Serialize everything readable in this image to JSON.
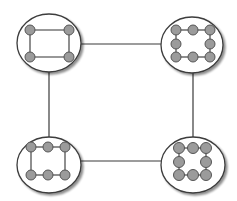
{
  "diagram": {
    "type": "network-of-clusters",
    "width": 237,
    "height": 201,
    "colors": {
      "background": "#ffffff",
      "edge": "#3a3a3a",
      "cluster_fill": "#ffffff",
      "cluster_stroke": "#3c3c3c",
      "cluster_shadow": "#9a9a9a",
      "node_fill": "#9b9b9b",
      "node_stroke": "#555555",
      "inner_edge": "#333333"
    },
    "inter_cluster_edges": [
      {
        "id": "top",
        "x1": 81,
        "y1": 44,
        "x2": 162,
        "y2": 44
      },
      {
        "id": "bottom",
        "x1": 81,
        "y1": 161,
        "x2": 161,
        "y2": 161
      },
      {
        "id": "left",
        "x1": 49,
        "y1": 72,
        "x2": 49,
        "y2": 137
      },
      {
        "id": "right",
        "x1": 193,
        "y1": 73,
        "x2": 193,
        "y2": 138
      }
    ],
    "clusters": [
      {
        "id": "top-left",
        "cx": 49,
        "cy": 43,
        "rx": 32,
        "ry": 29,
        "node_r": 5,
        "nodes": [
          [
            30,
            30
          ],
          [
            69,
            30
          ],
          [
            69,
            57
          ],
          [
            30,
            57
          ]
        ],
        "ring": true
      },
      {
        "id": "top-right",
        "cx": 192,
        "cy": 45,
        "rx": 31,
        "ry": 28,
        "node_r": 5,
        "nodes": [
          [
            176,
            30
          ],
          [
            193,
            30
          ],
          [
            210,
            30
          ],
          [
            210,
            44
          ],
          [
            210,
            57
          ],
          [
            193,
            57
          ],
          [
            176,
            57
          ],
          [
            176,
            44
          ]
        ],
        "ring": true
      },
      {
        "id": "bottom-left",
        "cx": 49,
        "cy": 165,
        "rx": 32,
        "ry": 28,
        "node_r": 5,
        "nodes": [
          [
            31,
            147
          ],
          [
            48,
            147
          ],
          [
            65,
            147
          ],
          [
            65,
            175
          ],
          [
            48,
            175
          ],
          [
            31,
            175
          ]
        ],
        "ring": true
      },
      {
        "id": "bottom-right",
        "cx": 193,
        "cy": 165,
        "rx": 32,
        "ry": 28,
        "node_r": 5.5,
        "nodes": [
          [
            179,
            148
          ],
          [
            193,
            148
          ],
          [
            206,
            148
          ],
          [
            206,
            162
          ],
          [
            206,
            175
          ],
          [
            193,
            175
          ],
          [
            179,
            175
          ],
          [
            179,
            162
          ]
        ],
        "ring": true
      }
    ]
  }
}
